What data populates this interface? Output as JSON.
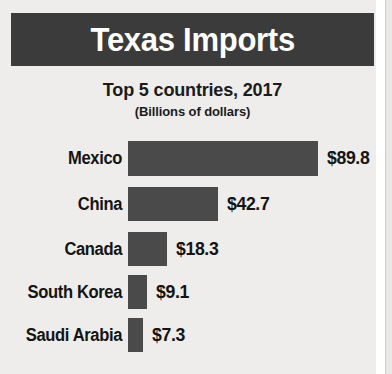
{
  "header": {
    "title": "Texas Imports"
  },
  "subtitle": {
    "main": "Top 5 countries, 2017",
    "units": "(Billions of dollars)"
  },
  "colors": {
    "header_bar": "#3b3b3b",
    "bar_fill": "#4a4a4a",
    "panel_background": "#eeedeb",
    "text": "#141414",
    "header_text": "#ffffff"
  },
  "chart_data": {
    "type": "bar",
    "orientation": "horizontal",
    "title": "Texas Imports",
    "subtitle": "Top 5 countries, 2017",
    "units": "Billions of dollars",
    "xlabel": "",
    "ylabel": "",
    "grid": false,
    "legend": false,
    "xlim": [
      0,
      89.8
    ],
    "categories": [
      "Mexico",
      "China",
      "Canada",
      "South Korea",
      "Saudi Arabia"
    ],
    "values": [
      89.8,
      42.7,
      18.3,
      9.1,
      7.3
    ],
    "value_labels": [
      "$89.8",
      "$42.7",
      "$18.3",
      "$9.1",
      "$7.3"
    ],
    "rows": [
      {
        "category": "Mexico",
        "value": 89.8,
        "label": "$89.8"
      },
      {
        "category": "China",
        "value": 42.7,
        "label": "$42.7"
      },
      {
        "category": "Canada",
        "value": 18.3,
        "label": "$18.3"
      },
      {
        "category": "South Korea",
        "value": 9.1,
        "label": "$9.1"
      },
      {
        "category": "Saudi Arabia",
        "value": 7.3,
        "label": "$7.3"
      }
    ]
  }
}
